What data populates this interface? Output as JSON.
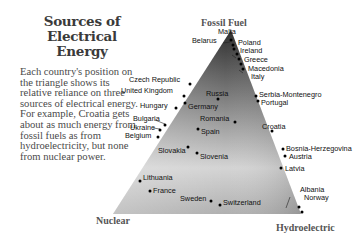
{
  "title": {
    "line1": "Sources of",
    "line2": "Electrical Energy"
  },
  "description": "Each country's position on the triangle shows its relative reliance on three sources of electrical energy. For example, Croatia gets about as much energy from fossil fuels as from hydroelectricity, but none from nuclear power.",
  "vertices": {
    "top": "Fossil Fuel",
    "bottom_left": "Nuclear",
    "bottom_right": "Hydroelectric"
  },
  "countries": [
    {
      "name": "Malta"
    },
    {
      "name": "Belarus"
    },
    {
      "name": "Poland"
    },
    {
      "name": "Ireland"
    },
    {
      "name": "Greece"
    },
    {
      "name": "Macedonia"
    },
    {
      "name": "Italy"
    },
    {
      "name": "Czech Republic"
    },
    {
      "name": "United Kingdom"
    },
    {
      "name": "Russia"
    },
    {
      "name": "Serbia-Montenegro"
    },
    {
      "name": "Portugal"
    },
    {
      "name": "Hungary"
    },
    {
      "name": "Germany"
    },
    {
      "name": "Bulgaria"
    },
    {
      "name": "Romania"
    },
    {
      "name": "Ukraine"
    },
    {
      "name": "Spain"
    },
    {
      "name": "Belgium"
    },
    {
      "name": "Croatia"
    },
    {
      "name": "Slovakia"
    },
    {
      "name": "Slovenia"
    },
    {
      "name": "Bosnia-Herzegovina"
    },
    {
      "name": "Austria"
    },
    {
      "name": "Latvia"
    },
    {
      "name": "Lithuania"
    },
    {
      "name": "France"
    },
    {
      "name": "Sweden"
    },
    {
      "name": "Switzerland"
    },
    {
      "name": "Albania"
    },
    {
      "name": "Norway"
    }
  ],
  "colors": {
    "triangle_top": "#3a3a3a",
    "triangle_bottom": "#d8d8d8",
    "text": "#333333"
  }
}
